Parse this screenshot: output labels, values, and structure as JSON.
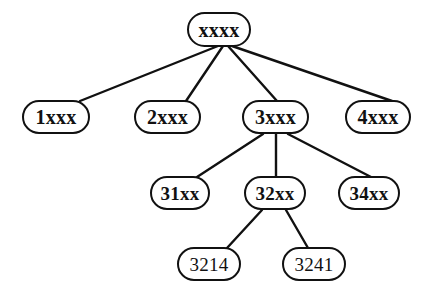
{
  "diagram": {
    "background_color": "#ffffff",
    "stroke_color": "#111111",
    "nodes": [
      {
        "id": "root",
        "label": "xxxx",
        "level": 0,
        "x": 187,
        "y": 12,
        "w": 64,
        "h": 35
      },
      {
        "id": "n1",
        "label": "1xxx",
        "level": 1,
        "x": 22,
        "y": 100,
        "w": 68,
        "h": 34
      },
      {
        "id": "n2",
        "label": "2xxx",
        "level": 1,
        "x": 134,
        "y": 100,
        "w": 67,
        "h": 34
      },
      {
        "id": "n3",
        "label": "3xxx",
        "level": 1,
        "x": 242,
        "y": 100,
        "w": 67,
        "h": 34
      },
      {
        "id": "n4",
        "label": "4xxx",
        "level": 1,
        "x": 345,
        "y": 100,
        "w": 66,
        "h": 34
      },
      {
        "id": "n31",
        "label": "31xx",
        "level": 2,
        "x": 150,
        "y": 176,
        "w": 60,
        "h": 34
      },
      {
        "id": "n32",
        "label": "32xx",
        "level": 2,
        "x": 244,
        "y": 176,
        "w": 62,
        "h": 34
      },
      {
        "id": "n34",
        "label": "34xx",
        "level": 2,
        "x": 338,
        "y": 176,
        "w": 62,
        "h": 34
      },
      {
        "id": "n3214",
        "label": "3214",
        "level": 3,
        "x": 177,
        "y": 247,
        "w": 64,
        "h": 34
      },
      {
        "id": "n3241",
        "label": "3241",
        "level": 3,
        "x": 282,
        "y": 247,
        "w": 64,
        "h": 34
      }
    ],
    "edges": [
      {
        "from": "root",
        "to": "n1",
        "x1": 218,
        "y1": 46,
        "x2": 80,
        "y2": 101
      },
      {
        "from": "root",
        "to": "n2",
        "x1": 223,
        "y1": 46,
        "x2": 186,
        "y2": 101
      },
      {
        "from": "root",
        "to": "n3",
        "x1": 228,
        "y1": 46,
        "x2": 277,
        "y2": 101
      },
      {
        "from": "root",
        "to": "n4",
        "x1": 232,
        "y1": 46,
        "x2": 392,
        "y2": 101
      },
      {
        "from": "n3",
        "to": "n31",
        "x1": 263,
        "y1": 134,
        "x2": 197,
        "y2": 177
      },
      {
        "from": "n3",
        "to": "n32",
        "x1": 276,
        "y1": 134,
        "x2": 276,
        "y2": 177
      },
      {
        "from": "n3",
        "to": "n34",
        "x1": 288,
        "y1": 134,
        "x2": 371,
        "y2": 177
      },
      {
        "from": "n32",
        "to": "n3214",
        "x1": 262,
        "y1": 210,
        "x2": 227,
        "y2": 248
      },
      {
        "from": "n32",
        "to": "n3241",
        "x1": 286,
        "y1": 210,
        "x2": 308,
        "y2": 248
      }
    ]
  }
}
